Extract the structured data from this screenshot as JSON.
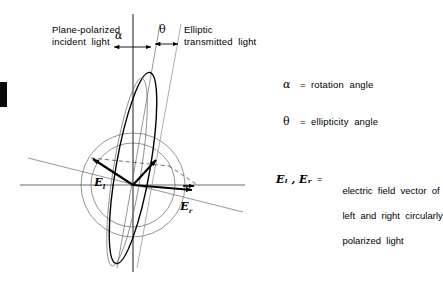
{
  "figure": {
    "title_left": "Plane-polarized\nincident  light",
    "title_right": "Elliptic\ntransmitted  light",
    "angle_alpha_symbol": "α",
    "angle_theta_symbol": "θ",
    "vector_left_label": "E",
    "vector_left_subscript": "l",
    "vector_right_label": "E",
    "vector_right_subscript": "r"
  },
  "legend_angles": [
    {
      "symbol": "α",
      "equals": "=",
      "text": "rotation  angle"
    },
    {
      "symbol": "θ",
      "equals": "=",
      "text": "ellipticity  angle"
    }
  ],
  "legend_vectors": {
    "symbols": "Eₗ ,  Eᵣ",
    "equals": "=",
    "line1": "electric  field  vector  of",
    "line2": "left  and  right  circularly",
    "line3": "polarized  light"
  },
  "colors": {
    "ink": "#000000",
    "thin_rule": "#6a6a6a",
    "circle": "#7a7a7a",
    "background": "#ffffff"
  }
}
